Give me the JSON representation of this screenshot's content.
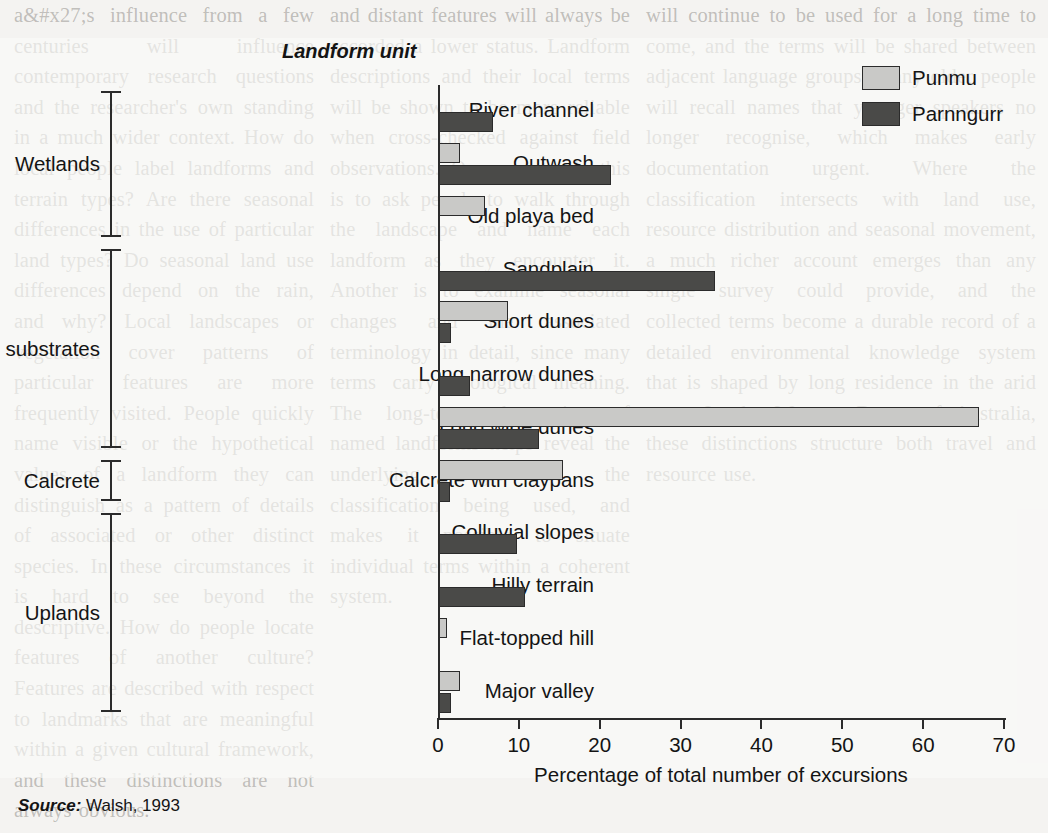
{
  "figure": {
    "axis_title_top": "Landform unit",
    "source_prefix": "Source:",
    "source_text": "Walsh, 1993"
  },
  "legend": {
    "position": "top-right",
    "entries": [
      {
        "label": "Punmu",
        "color": "#c9c9c7"
      },
      {
        "label": "Parnngurr",
        "color": "#4a4a48"
      }
    ]
  },
  "groups": [
    {
      "label": "Wetlands",
      "start": 0,
      "end": 2
    },
    {
      "label": "Sand substrates",
      "start": 3,
      "end": 6
    },
    {
      "label": "Calcrete",
      "start": 7,
      "end": 7
    },
    {
      "label": "Uplands",
      "start": 8,
      "end": 11
    }
  ],
  "chart_data": {
    "type": "bar",
    "orientation": "horizontal",
    "title": "Landform unit",
    "xlabel": "Percentage of total number of excursions",
    "ylabel": "Landform unit",
    "xlim": [
      0,
      70
    ],
    "xticks": [
      0,
      10,
      20,
      30,
      40,
      50,
      60,
      70
    ],
    "grid": false,
    "legend_position": "top-right",
    "categories": [
      "River channel",
      "Outwash",
      "Old playa bed",
      "Sandplain",
      "Short dunes",
      "Long narrow dunes",
      "Long wide dunes",
      "Calcrete with claypans",
      "Colluvial slopes",
      "Hilly terrain",
      "Flat-topped hill",
      "Major valley"
    ],
    "series": [
      {
        "name": "Punmu",
        "color": "#c9c9c7",
        "values": [
          0,
          2.6,
          5.7,
          0,
          8.5,
          0,
          66.8,
          15.3,
          0,
          0,
          1.0,
          2.6
        ]
      },
      {
        "name": "Parnngurr",
        "color": "#4a4a48",
        "values": [
          6.7,
          21.3,
          0,
          34.1,
          1.5,
          3.8,
          12.4,
          1.4,
          9.6,
          10.6,
          0,
          1.5
        ]
      }
    ],
    "source": "Source: Walsh, 1993"
  },
  "xticklabels": [
    "0",
    "10",
    "20",
    "30",
    "40",
    "50",
    "60",
    "70"
  ],
  "background_text": {
    "left": "a&#x27;s influence from a few centuries will influence contemporary research questions and the researcher's own standing in a much wider context. How do local people label landforms and terrain types? Are there seasonal differences in the use of particular land types? Do seasonal land use differences depend on the rain, and why? Local landscapes or vegetation cover patterns of particular features are more frequently visited. People quickly name visible or the hypothetical values of a landform they can distinguish as a pattern of details of associated or other distinct species. In these circumstances it is hard to see beyond the descriptive. How do people locate features of another culture? Features are described with respect to landmarks that are meaningful within a given cultural framework, and these distinctions are not always obvious.",
    "mid": "and distant features will always be accorded a lower status. Landform descriptions and their local terms will be shown to be more reliable when cross-checked against field observations. One way to do this is to ask people to walk through the landscape and name each landform as they encounter it. Another is to examine seasonal changes and the associated terminology in detail, since many terms carry ecological meaning. The long-term observation of named landforms helps reveal the underlying logic of the classification being used, and makes it possible to situate individual terms within a coherent system.",
    "right": "will continue to be used for a long time to come, and the terms will be shared between adjacent language groups. Many older people will recall names that younger speakers no longer recognise, which makes early documentation urgent. Where the classification intersects with land use, resource distribution and seasonal movement, a much richer account emerges than any single survey could provide, and the collected terms become a durable record of a detailed environmental knowledge system that is shaped by long residence in the arid zone. In the Western Desert of Australia, these distinctions structure both travel and resource use."
  }
}
